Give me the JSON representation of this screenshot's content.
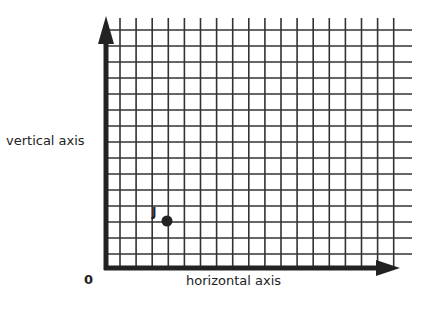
{
  "diagram": {
    "y_axis_label": "vertical axis",
    "x_axis_label": "horizontal axis",
    "origin_label": "0",
    "point": {
      "label": "J",
      "grid_x": 3,
      "grid_y": 3
    },
    "grid": {
      "columns": 18,
      "rows": 15
    },
    "colors": {
      "axis": "#222222",
      "grid": "#333333",
      "point": "#222222"
    }
  }
}
